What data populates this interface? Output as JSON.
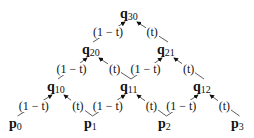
{
  "weights": {
    "left": "(1 − t)",
    "right": "(t)"
  },
  "nodes": [
    {
      "id": "q30",
      "base": "q",
      "sub": "30",
      "x": 120,
      "y": 7
    },
    {
      "id": "q20",
      "base": "q",
      "sub": "20",
      "x": 82,
      "y": 43
    },
    {
      "id": "q21",
      "base": "q",
      "sub": "21",
      "x": 157,
      "y": 43
    },
    {
      "id": "q10",
      "base": "q",
      "sub": "10",
      "x": 47,
      "y": 80
    },
    {
      "id": "q11",
      "base": "q",
      "sub": "11",
      "x": 120,
      "y": 80
    },
    {
      "id": "q12",
      "base": "q",
      "sub": "12",
      "x": 193,
      "y": 80
    },
    {
      "id": "p0",
      "base": "p",
      "sub": "0",
      "x": 9,
      "y": 117
    },
    {
      "id": "p1",
      "base": "p",
      "sub": "1",
      "x": 84,
      "y": 117
    },
    {
      "id": "p2",
      "base": "p",
      "sub": "2",
      "x": 158,
      "y": 117
    },
    {
      "id": "p3",
      "base": "p",
      "sub": "3",
      "x": 231,
      "y": 117
    }
  ],
  "edges": [
    {
      "from": "q20",
      "to": "q30",
      "label": "(1 − t)"
    },
    {
      "from": "q21",
      "to": "q30",
      "label": "(t)"
    },
    {
      "from": "q10",
      "to": "q20",
      "label": "(1 − t)"
    },
    {
      "from": "q11",
      "to": "q20",
      "label": "(t)"
    },
    {
      "from": "q11",
      "to": "q21",
      "label": "(1 − t)"
    },
    {
      "from": "q12",
      "to": "q21",
      "label": "(t)"
    },
    {
      "from": "p0",
      "to": "q10",
      "label": "(1 − t)"
    },
    {
      "from": "p1",
      "to": "q10",
      "label": "(t)"
    },
    {
      "from": "p1",
      "to": "q11",
      "label": "(1 − t)"
    },
    {
      "from": "p2",
      "to": "q11",
      "label": "(t)"
    },
    {
      "from": "p2",
      "to": "q12",
      "label": "(1 − t)"
    },
    {
      "from": "p3",
      "to": "q12",
      "label": "(t)"
    }
  ]
}
